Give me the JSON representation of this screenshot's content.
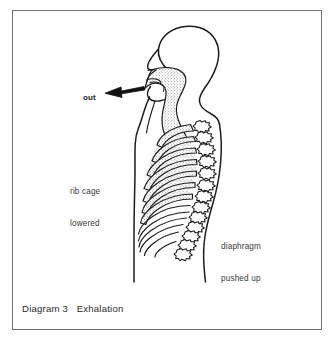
{
  "figure": {
    "title": "Diagram 3   Exhalation",
    "caption_number": "Diagram 3",
    "caption_text": "Exhalation",
    "frame_color": "#6e6e6e",
    "background_color": "#ffffff",
    "ink_color": "#1c1c1c"
  },
  "labels": {
    "airflow": "out",
    "ribcage_line1": "rib cage",
    "ribcage_line2": "lowered",
    "diaphragm_line1": "diaphragm",
    "diaphragm_line2": "pushed up"
  },
  "anatomy": {
    "view": "left-facing human head and torso profile",
    "airway_fill": "stippled",
    "upper_ribs_fill": "stippled",
    "lower_ribs_fill": "outline",
    "rib_count_stippled": 7,
    "rib_count_plain": 5,
    "vertebra_count": 13,
    "arrow_direction": "left",
    "arrow_label": "out"
  }
}
